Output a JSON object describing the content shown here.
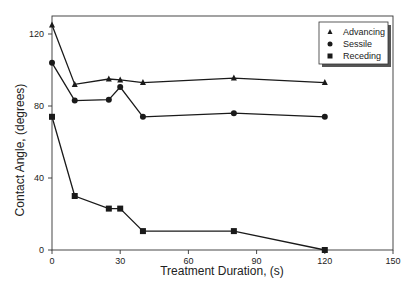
{
  "chart_data": {
    "type": "line",
    "title": "",
    "xlabel": "Treatment Duration, (s)",
    "ylabel": "Contact Angle, (degrees)",
    "xlim": [
      0,
      150
    ],
    "ylim": [
      0,
      130
    ],
    "xticks": [
      0,
      30,
      60,
      90,
      120,
      150
    ],
    "yticks": [
      0,
      40,
      80,
      120
    ],
    "grid": false,
    "legend_position": "upper right",
    "x": [
      0,
      10,
      25,
      30,
      40,
      80,
      120
    ],
    "series": [
      {
        "name": "Advancing",
        "marker": "triangle",
        "values": [
          125,
          92,
          95,
          94.5,
          93,
          95.5,
          93
        ]
      },
      {
        "name": "Sessile",
        "marker": "circle",
        "values": [
          104,
          83,
          83.5,
          90.5,
          74,
          76,
          74
        ]
      },
      {
        "name": "Receding",
        "marker": "square",
        "values": [
          74,
          30,
          23,
          23,
          10.5,
          10.5,
          0
        ]
      }
    ]
  },
  "colors": {
    "line": "#1a1a1a",
    "frame": "#333333",
    "background": "#ffffff"
  }
}
